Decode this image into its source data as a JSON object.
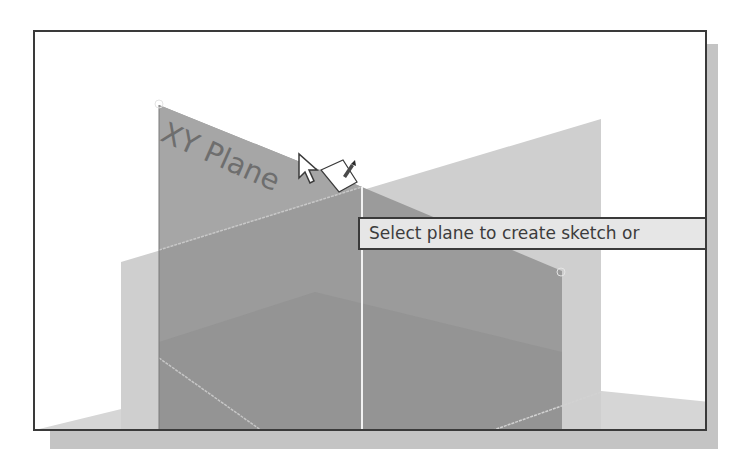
{
  "viewport": {
    "background": "#ffffff",
    "border_color": "#3a3a3a"
  },
  "scene": {
    "planes": [
      {
        "name": "XY Plane",
        "label": "XY Plane",
        "state": "highlighted",
        "color": "#9a9a9a"
      },
      {
        "name": "YZ Plane",
        "state": "default",
        "color": "#cccccc"
      },
      {
        "name": "XZ Plane",
        "state": "default",
        "color": "#d6d6d6"
      }
    ],
    "origin_axis_color": "#f0f0f0"
  },
  "cursor": {
    "icon": "select-pointer-with-sketch-pencil"
  },
  "tooltip": {
    "text": "Select plane to create sketch or"
  }
}
